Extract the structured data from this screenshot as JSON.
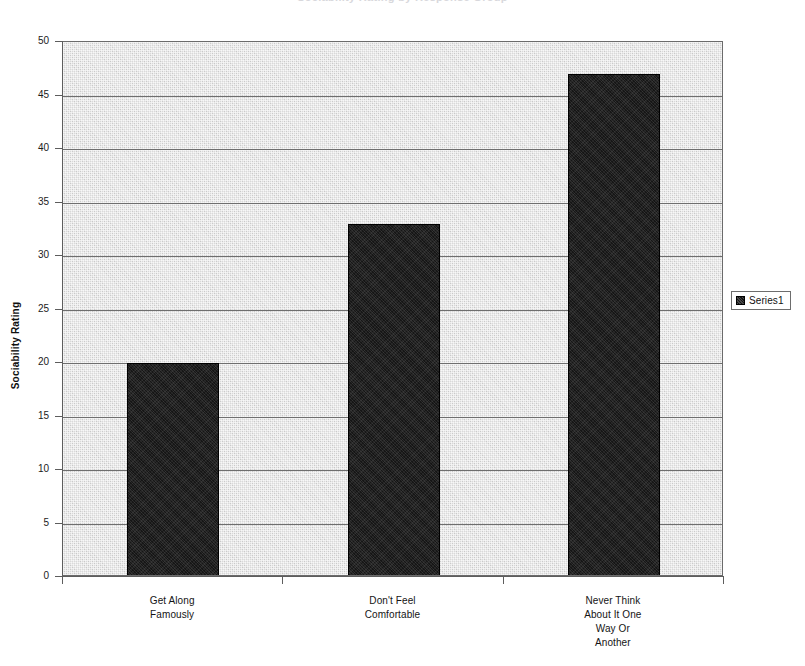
{
  "chart_data": {
    "type": "bar",
    "title": "Sociability Rating by Response Group",
    "xlabel": "",
    "ylabel": "Sociability Rating",
    "ylim": [
      0,
      50
    ],
    "ytick_step": 5,
    "yticks": [
      50,
      45,
      40,
      35,
      30,
      25,
      20,
      15,
      10,
      5,
      0
    ],
    "grid": true,
    "legend_position": "right",
    "categories": [
      "Get Along\nFamously",
      "Don't Feel\nComfortable",
      "Never Think\nAbout It One\nWay Or\nAnother"
    ],
    "category_lines": [
      [
        "Get Along",
        "Famously"
      ],
      [
        "Don't Feel",
        "Comfortable"
      ],
      [
        "Never Think",
        "About It One",
        "Way Or",
        "Another"
      ]
    ],
    "series": [
      {
        "name": "Series1",
        "values": [
          20,
          33,
          47
        ],
        "color": "#161616"
      }
    ],
    "plot_background": "#d9d9d9",
    "axis_color": "#5d5d5d",
    "gridline_color": "#6e6e6e"
  },
  "legend": {
    "entries": [
      {
        "label": "Series1",
        "swatch_color": "#161616"
      }
    ]
  },
  "axes": {
    "y_title": "Sociability Rating"
  }
}
